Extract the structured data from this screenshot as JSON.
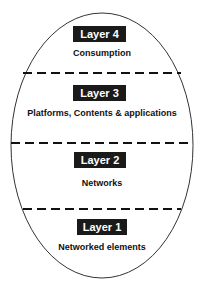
{
  "diagram": {
    "shape": "ellipse",
    "colors": {
      "outline": "#333333",
      "dash": "#111111",
      "label_bg": "#1a1a1a",
      "label_text": "#ffffff",
      "text": "#111111"
    },
    "layers": [
      {
        "label": "Layer 4",
        "description": "Consumption"
      },
      {
        "label": "Layer 3",
        "description": "Platforms, Contents & applications"
      },
      {
        "label": "Layer 2",
        "description": "Networks"
      },
      {
        "label": "Layer 1",
        "description": "Networked elements"
      }
    ]
  }
}
